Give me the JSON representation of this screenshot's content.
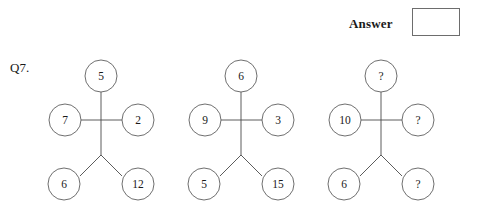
{
  "answer": {
    "label": "Answer",
    "value": ""
  },
  "question": {
    "number": "Q7."
  },
  "diagrams": [
    {
      "name": "diagram-1",
      "nodes": {
        "top": "5",
        "left": "7",
        "right": "2",
        "bottom_left": "6",
        "bottom_right": "12"
      }
    },
    {
      "name": "diagram-2",
      "nodes": {
        "top": "6",
        "left": "9",
        "right": "3",
        "bottom_left": "5",
        "bottom_right": "15"
      }
    },
    {
      "name": "diagram-3",
      "nodes": {
        "top": "?",
        "left": "10",
        "right": "?",
        "bottom_left": "6",
        "bottom_right": "?"
      }
    }
  ],
  "colors": {
    "stroke": "#5f5f5f",
    "edge": "#4a4a4a",
    "text": "#1a1a1a",
    "box_border": "#6d6d6d",
    "background": "#ffffff"
  }
}
